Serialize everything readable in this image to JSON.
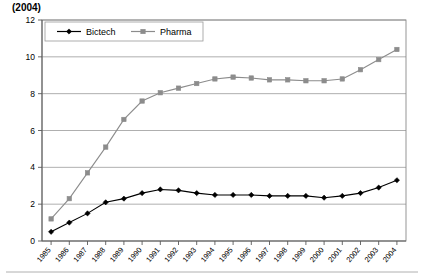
{
  "chart_title": "(2004)",
  "legend": {
    "position": "top-center-inside",
    "entries": [
      {
        "label": "Bictech",
        "color": "#000000",
        "marker": "diamond"
      },
      {
        "label": "Pharma",
        "color": "#8c8c8c",
        "marker": "square"
      }
    ]
  },
  "axes": {
    "y_ticks": [
      "0",
      "2",
      "4",
      "6",
      "8",
      "10",
      "12"
    ],
    "x_ticks": [
      "1985",
      "1986",
      "1987",
      "1988",
      "1989",
      "1990",
      "1991",
      "1992",
      "1993",
      "1994",
      "1995",
      "1996",
      "1997",
      "1998",
      "1999",
      "2000",
      "2001",
      "2002",
      "2003",
      "2004"
    ]
  },
  "chart_data": {
    "type": "line",
    "title": "(2004)",
    "xlabel": "",
    "ylabel": "",
    "ylim": [
      0,
      12
    ],
    "ytick_step": 2,
    "grid": "horizontal",
    "legend_position": "top-center-inside",
    "categories": [
      "1985",
      "1986",
      "1987",
      "1988",
      "1989",
      "1990",
      "1991",
      "1992",
      "1993",
      "1994",
      "1995",
      "1996",
      "1997",
      "1998",
      "1999",
      "2000",
      "2001",
      "2002",
      "2003",
      "2004"
    ],
    "series": [
      {
        "name": "Bictech",
        "color": "#000000",
        "marker": "diamond",
        "values": [
          0.5,
          1.0,
          1.5,
          2.1,
          2.3,
          2.6,
          2.8,
          2.75,
          2.6,
          2.5,
          2.5,
          2.5,
          2.45,
          2.45,
          2.45,
          2.35,
          2.45,
          2.6,
          2.9,
          3.3
        ]
      },
      {
        "name": "Pharma",
        "color": "#8c8c8c",
        "marker": "square",
        "values": [
          1.2,
          2.3,
          3.7,
          5.1,
          6.6,
          7.6,
          8.05,
          8.3,
          8.55,
          8.8,
          8.9,
          8.85,
          8.75,
          8.75,
          8.7,
          8.7,
          8.8,
          9.3,
          9.85,
          10.4
        ]
      }
    ]
  }
}
